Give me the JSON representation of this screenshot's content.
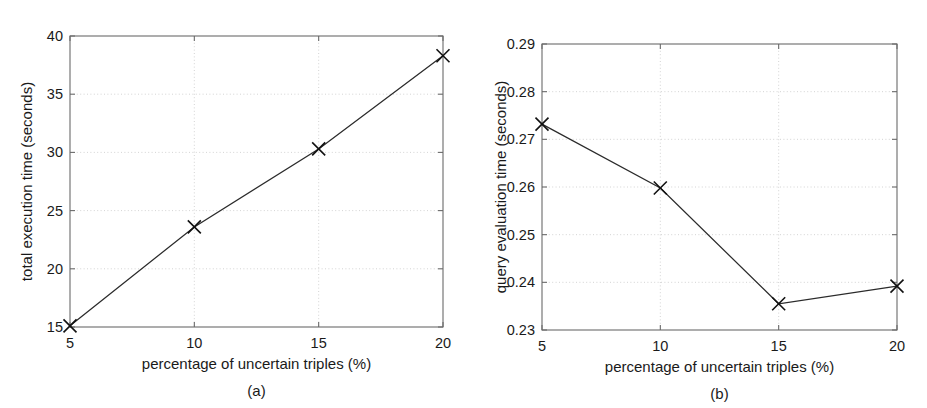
{
  "figure": {
    "panels": [
      {
        "id": "a",
        "caption": "(a)",
        "chart_data": {
          "type": "line",
          "title": "",
          "xlabel": "percentage of uncertain triples (%)",
          "ylabel": "total execution time (seconds)",
          "x": [
            5,
            10,
            15,
            20
          ],
          "values": [
            15.1,
            23.6,
            30.3,
            38.3
          ],
          "xticks": [
            5,
            10,
            15,
            20
          ],
          "xtick_labels": [
            "5",
            "10",
            "15",
            "20"
          ],
          "yticks": [
            15,
            20,
            25,
            30,
            35,
            40
          ],
          "ytick_labels": [
            "15",
            "20",
            "25",
            "30",
            "35",
            "40"
          ],
          "xlim": [
            5,
            20
          ],
          "ylim": [
            15,
            40
          ],
          "grid": true,
          "legend": "none",
          "marker": "x",
          "line_color": "#2b2b2b"
        }
      },
      {
        "id": "b",
        "caption": "(b)",
        "chart_data": {
          "type": "line",
          "title": "",
          "xlabel": "percentage of uncertain triples (%)",
          "ylabel": "query evaluation time (seconds)",
          "x": [
            5,
            10,
            15,
            20
          ],
          "values": [
            0.2732,
            0.2598,
            0.2355,
            0.2392
          ],
          "xticks": [
            5,
            10,
            15,
            20
          ],
          "xtick_labels": [
            "5",
            "10",
            "15",
            "20"
          ],
          "yticks": [
            0.23,
            0.24,
            0.25,
            0.26,
            0.27,
            0.28,
            0.29
          ],
          "ytick_labels": [
            "0.23",
            "0.24",
            "0.25",
            "0.26",
            "0.27",
            "0.28",
            "0.29"
          ],
          "xlim": [
            5,
            20
          ],
          "ylim": [
            0.23,
            0.29
          ],
          "grid": true,
          "legend": "none",
          "marker": "x",
          "line_color": "#2b2b2b"
        }
      }
    ]
  },
  "colors": {
    "background": "#ffffff",
    "axis": "#6b6b6b",
    "grid": "#cfcfcf",
    "series": "#2b2b2b",
    "text": "#1a1a1a"
  }
}
